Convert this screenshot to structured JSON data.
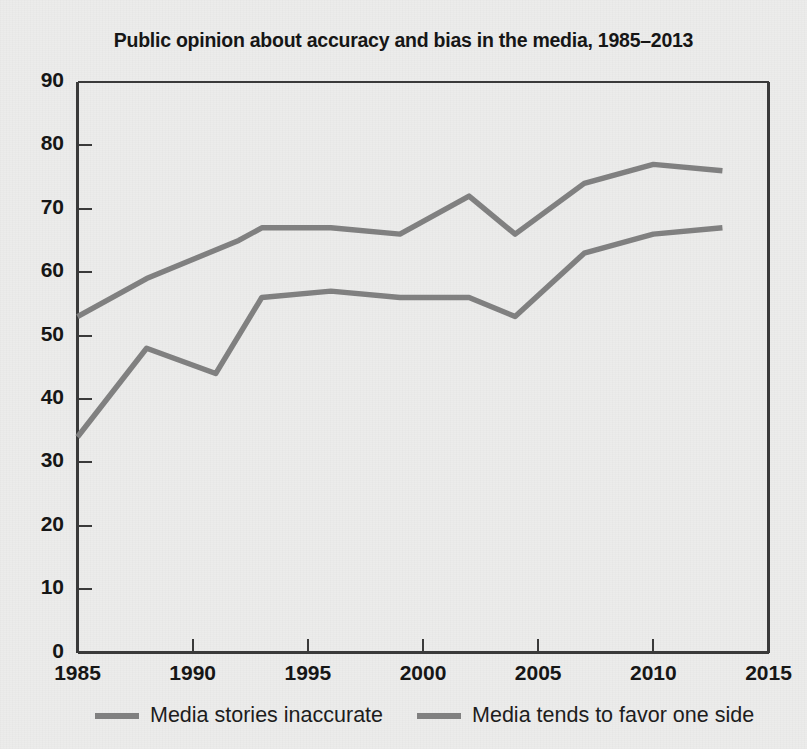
{
  "chart_data": {
    "type": "line",
    "title": "Public opinion about accuracy and bias in the media, 1985–2013",
    "xlabel": "",
    "ylabel": "",
    "xlim": [
      1985,
      2015
    ],
    "ylim": [
      0,
      90
    ],
    "xticks": [
      1985,
      1990,
      1995,
      2000,
      2005,
      2010,
      2015
    ],
    "xtick_labels": [
      "1985",
      "1990",
      "1995",
      "2000",
      "2005",
      "2010",
      "2015"
    ],
    "yticks": [
      0,
      10,
      20,
      30,
      40,
      50,
      60,
      70,
      80,
      90
    ],
    "ytick_labels": [
      "0",
      "10",
      "20",
      "30",
      "40",
      "50",
      "60",
      "70",
      "80",
      "90"
    ],
    "grid": false,
    "legend_position": "below",
    "series": [
      {
        "name": "Media tends to favor one side",
        "color": "#808080",
        "x": [
          1985,
          1988,
          1992,
          1993,
          1996,
          1999,
          2002,
          2004,
          2007,
          2010,
          2013
        ],
        "values": [
          53,
          59,
          65,
          67,
          67,
          66,
          72,
          66,
          74,
          77,
          76
        ]
      },
      {
        "name": "Media stories inaccurate",
        "color": "#808080",
        "x": [
          1985,
          1988,
          1991,
          1993,
          1996,
          1999,
          2002,
          2004,
          2007,
          2010,
          2013
        ],
        "values": [
          34,
          48,
          44,
          56,
          57,
          56,
          56,
          53,
          63,
          66,
          67
        ]
      }
    ]
  },
  "legend": {
    "entries": [
      {
        "label": "Media stories inaccurate",
        "color": "#808080"
      },
      {
        "label": "Media tends to favor one side",
        "color": "#808080"
      }
    ]
  },
  "colors": {
    "line": "#808080",
    "axis": "#3a3a3a",
    "text": "#161616",
    "background": "#ececeb"
  }
}
